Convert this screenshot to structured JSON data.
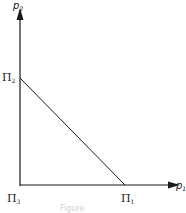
{
  "diagram": {
    "y_axis_label": {
      "main": "p",
      "sub": "2"
    },
    "x_axis_label": {
      "main": "p",
      "sub": "1"
    },
    "points": {
      "pi2": {
        "main": "Π",
        "sub": "2"
      },
      "pi3": {
        "main": "Π",
        "sub": "3"
      },
      "pi1": {
        "main": "Π",
        "sub": "1"
      }
    },
    "caption": "Figure"
  },
  "colors": {
    "line": "#1a1a1a",
    "background": "#ffffff"
  }
}
